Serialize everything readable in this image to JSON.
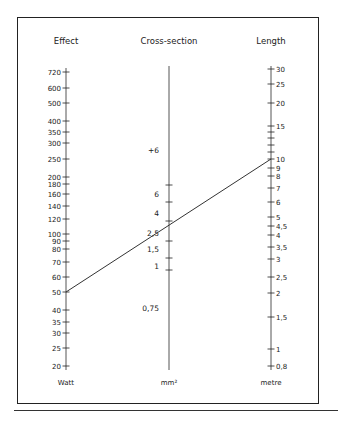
{
  "nomogram": {
    "columns": [
      {
        "id": "effect",
        "title": "Effect",
        "unit": "Watt",
        "x": 66,
        "axis_top": 68,
        "axis_bottom": 370,
        "ticks": [
          {
            "label": "720",
            "y": 72
          },
          {
            "label": "600",
            "y": 88
          },
          {
            "label": "500",
            "y": 103
          },
          {
            "label": "400",
            "y": 121
          },
          {
            "label": "350",
            "y": 132
          },
          {
            "label": "300",
            "y": 143
          },
          {
            "label": "250",
            "y": 159
          },
          {
            "label": "200",
            "y": 177
          },
          {
            "label": "180",
            "y": 184
          },
          {
            "label": "160",
            "y": 194
          },
          {
            "label": "140",
            "y": 206
          },
          {
            "label": "120",
            "y": 219
          },
          {
            "label": "100",
            "y": 234
          },
          {
            "label": "90",
            "y": 241
          },
          {
            "label": "80",
            "y": 249
          },
          {
            "label": "70",
            "y": 262
          },
          {
            "label": "60",
            "y": 277
          },
          {
            "label": "50",
            "y": 292
          },
          {
            "label": "40",
            "y": 310
          },
          {
            "label": "35",
            "y": 322
          },
          {
            "label": "30",
            "y": 333
          },
          {
            "label": "25",
            "y": 348
          },
          {
            "label": "20",
            "y": 366
          }
        ]
      },
      {
        "id": "cross-section",
        "title": "Cross-section",
        "unit": "mm²",
        "x": 169,
        "axis_top": 66,
        "axis_bottom": 370,
        "ticks": [
          {
            "label": "",
            "y": 185
          },
          {
            "label": "",
            "y": 202
          },
          {
            "label": "",
            "y": 221
          },
          {
            "label": "",
            "y": 241
          },
          {
            "label": "",
            "y": 258
          },
          {
            "label": "",
            "y": 270
          }
        ],
        "labels": [
          {
            "label": "+6",
            "y": 150
          },
          {
            "label": "6",
            "y": 194
          },
          {
            "label": "4",
            "y": 213
          },
          {
            "label": "2,5",
            "y": 233
          },
          {
            "label": "1,5",
            "y": 249
          },
          {
            "label": "1",
            "y": 266
          },
          {
            "label": "0,75",
            "y": 308
          }
        ]
      },
      {
        "id": "length",
        "title": "Length",
        "unit": "metre",
        "x": 271,
        "axis_top": 66,
        "axis_bottom": 370,
        "ticks": [
          {
            "label": "30",
            "y": 69
          },
          {
            "label": "25",
            "y": 84
          },
          {
            "label": "20",
            "y": 103
          },
          {
            "label": "15",
            "y": 126
          },
          {
            "label": "",
            "y": 132
          },
          {
            "label": "",
            "y": 138
          },
          {
            "label": "",
            "y": 145
          },
          {
            "label": "",
            "y": 152
          },
          {
            "label": "10",
            "y": 159
          },
          {
            "label": "9",
            "y": 168
          },
          {
            "label": "8",
            "y": 176
          },
          {
            "label": "7",
            "y": 188
          },
          {
            "label": "6",
            "y": 202
          },
          {
            "label": "5",
            "y": 217
          },
          {
            "label": "4,5",
            "y": 226
          },
          {
            "label": "4",
            "y": 235
          },
          {
            "label": "3,5",
            "y": 247
          },
          {
            "label": "3",
            "y": 259
          },
          {
            "label": "2,5",
            "y": 277
          },
          {
            "label": "2",
            "y": 293
          },
          {
            "label": "1,5",
            "y": 317
          },
          {
            "label": "1",
            "y": 349
          },
          {
            "label": "0,8",
            "y": 366
          }
        ]
      }
    ],
    "example_line": {
      "from": {
        "x": 66,
        "y": 292
      },
      "to": {
        "x": 271,
        "y": 159
      },
      "color": "#333333"
    },
    "colors": {
      "ink": "#222222",
      "axis": "#555555"
    }
  }
}
